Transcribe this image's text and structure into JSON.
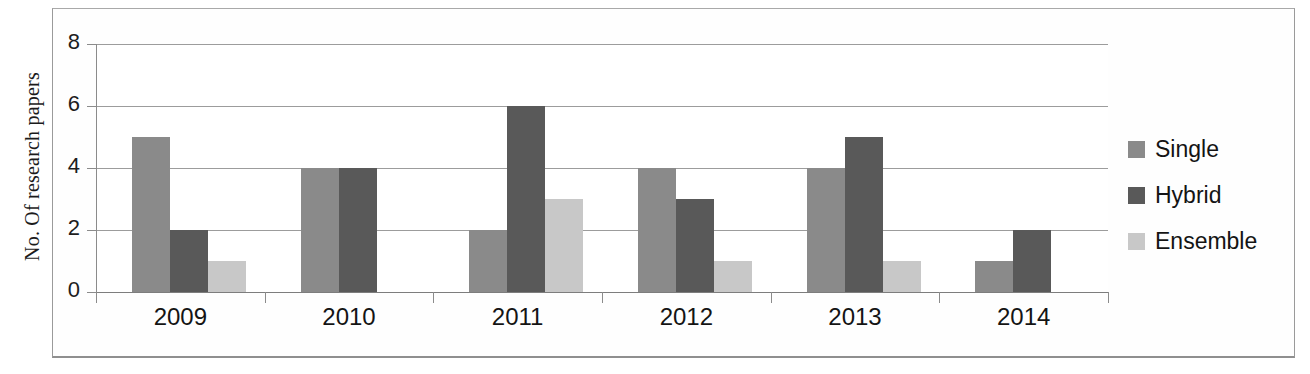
{
  "chart_data": {
    "type": "bar",
    "title": "",
    "xlabel": "",
    "ylabel": "No. Of research papers",
    "categories": [
      "2009",
      "2010",
      "2011",
      "2012",
      "2013",
      "2014"
    ],
    "series": [
      {
        "name": "Single",
        "color": "#8a8a8a",
        "values": [
          5,
          4,
          2,
          4,
          4,
          1
        ]
      },
      {
        "name": "Hybrid",
        "color": "#595959",
        "values": [
          2,
          4,
          6,
          3,
          5,
          2
        ]
      },
      {
        "name": "Ensemble",
        "color": "#c8c8c8",
        "values": [
          1,
          0,
          3,
          1,
          1,
          0
        ]
      }
    ],
    "ylim": [
      0,
      8
    ],
    "ytick_labels": [
      "0",
      "2",
      "4",
      "6",
      "8"
    ],
    "ytick_values": [
      0,
      2,
      4,
      6,
      8
    ],
    "grid": true,
    "legend_position": "right",
    "bar_gap_within_group": 0
  },
  "axes": {
    "y_title": "No. Of research papers"
  },
  "legend": {
    "items": [
      {
        "label": "Single",
        "color": "#8a8a8a"
      },
      {
        "label": "Hybrid",
        "color": "#595959"
      },
      {
        "label": "Ensemble",
        "color": "#c8c8c8"
      }
    ]
  },
  "colors": {
    "single": "#8a8a8a",
    "hybrid": "#595959",
    "ensemble": "#c8c8c8",
    "gridline": "#8b8b8b",
    "frame": "#9a9a9a",
    "text": "#141414",
    "background": "#ffffff"
  }
}
